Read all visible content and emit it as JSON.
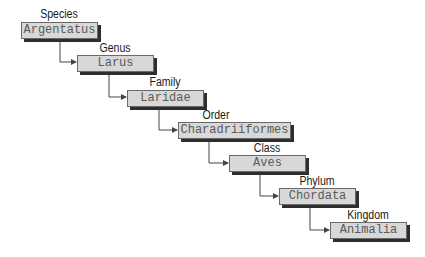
{
  "diagram": {
    "levels": [
      {
        "rank": "Species",
        "name": "Argentatus"
      },
      {
        "rank": "Genus",
        "name": "Larus"
      },
      {
        "rank": "Family",
        "name": "Laridae"
      },
      {
        "rank": "Order",
        "name": "Charadriiformes"
      },
      {
        "rank": "Class",
        "name": "Aves"
      },
      {
        "rank": "Phylum",
        "name": "Chordata"
      },
      {
        "rank": "Kingdom",
        "name": "Animalia"
      }
    ],
    "colors": {
      "box_fill": "#d8d8d8",
      "box_border": "#6a6a6a",
      "box_shadow": "#2e2e2e",
      "box_text": "#5a5a5a",
      "label_text": "#1a1a1a",
      "connector": "#444444"
    }
  }
}
